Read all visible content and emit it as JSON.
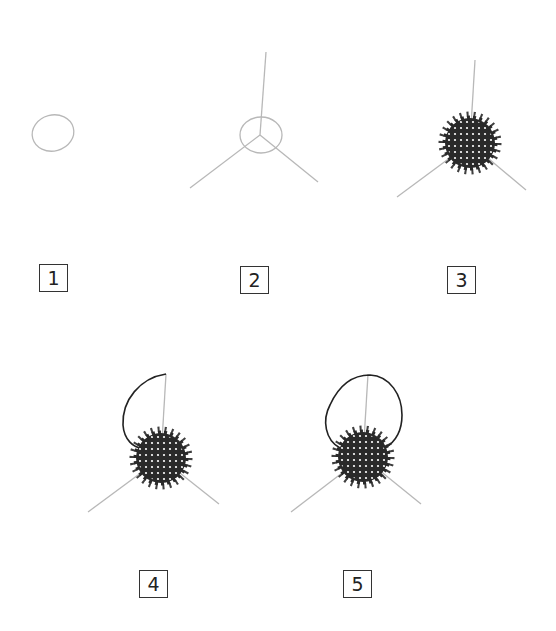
{
  "steps": [
    {
      "number": "1",
      "description": "Draw a small oval"
    },
    {
      "number": "2",
      "description": "Add three lines radiating from the oval center"
    },
    {
      "number": "3",
      "description": "Fill the oval with dense, textured florets"
    },
    {
      "number": "4",
      "description": "Draw a curved outline on the left from the top of the vertical line"
    },
    {
      "number": "5",
      "description": "Complete the rounded loop shape on the right"
    }
  ],
  "colors": {
    "sketch_line": "#b8b8b8",
    "ink": "#222222",
    "label_border": "#333333"
  }
}
